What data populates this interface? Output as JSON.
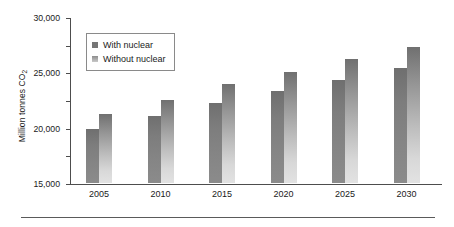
{
  "chart_data": {
    "type": "bar",
    "title": "",
    "xlabel": "",
    "ylabel": "Million tonnes CO",
    "ylabel_sub": "2",
    "categories": [
      "2005",
      "2010",
      "2015",
      "2020",
      "2025",
      "2030"
    ],
    "series": [
      {
        "name": "With nuclear",
        "values": [
          9700,
          12100,
          14400,
          16600,
          18700,
          20700
        ],
        "color": "#7d7d7d"
      },
      {
        "name": "Without nuclear",
        "values": [
          12400,
          15000,
          17900,
          20000,
          22400,
          24600
        ],
        "color": "#b4b4b4"
      }
    ],
    "ylim": [
      0,
      30000
    ],
    "ytick_values": [
      30000,
      25000,
      20000,
      15000,
      10000,
      5000,
      0
    ],
    "ytick_labels": [
      "30,000",
      "25,000",
      "20,000",
      "15,000",
      "10,000",
      "5000",
      "0"
    ],
    "grid": false,
    "legend_position": "top-left"
  }
}
